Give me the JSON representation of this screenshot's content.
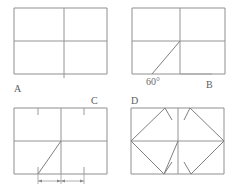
{
  "sheet": {
    "width": 238,
    "height": 196,
    "background": "#ffffff",
    "ink_color": "#8a8a8a",
    "label_color": "#5d5d5d"
  },
  "panels": [
    {
      "id": "A",
      "label": "A",
      "label_position": "below-left",
      "description": "rectangle divided by a horizontal midline and a vertical midline"
    },
    {
      "id": "B",
      "label": "B",
      "label_position": "below-right",
      "description": "rectangle with horizontal and vertical midlines plus a diagonal in the lower-left quadrant",
      "angle_label": "60°"
    },
    {
      "id": "C",
      "label": "C",
      "label_position": "above-right",
      "description": "rectangle with midlines, short tick marks on top and bottom edges, a diagonal to the centre, and a dimension line below",
      "dimension_labels": [
        "",
        ""
      ]
    },
    {
      "id": "D",
      "label": "D",
      "label_position": "above-left",
      "description": "rectangle with midlines and mirrored chevron construction lines in the left and right halves"
    }
  ],
  "annotations": {
    "angle_60": "60°",
    "dimension_left": "",
    "dimension_right": ""
  }
}
